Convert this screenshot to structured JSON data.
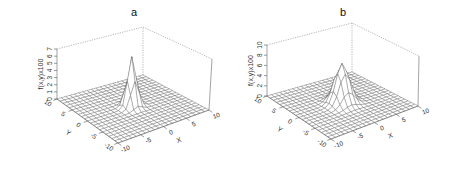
{
  "chart_data": [
    {
      "type": "surface3d",
      "title": "a",
      "xlabel": "X",
      "ylabel": "Y",
      "zlabel": "f(x,y)x100",
      "x_ticks": [
        -10,
        -5,
        0,
        5,
        10
      ],
      "y_ticks": [
        -10,
        -5,
        0,
        5,
        10
      ],
      "z_ticks": [
        0,
        1,
        2,
        3,
        4,
        5,
        6,
        7
      ],
      "xlim": [
        -10,
        10
      ],
      "ylim": [
        -10,
        10
      ],
      "zlim": [
        0,
        7
      ],
      "peak": {
        "x": 0,
        "y": 0,
        "z": 7
      },
      "grid_n": 20,
      "spread": 0.9,
      "geom": {
        "floor_left": [
          57,
          99
        ],
        "floor_front": [
          118,
          143
        ],
        "floor_right": [
          209,
          110
        ],
        "floor_back": [
          143,
          75
        ],
        "top_left": [
          57,
          49
        ],
        "top_back": [
          143,
          27
        ],
        "top_right": [
          212,
          59
        ],
        "title_pos": [
          134,
          16
        ]
      }
    },
    {
      "type": "surface3d",
      "title": "b",
      "xlabel": "X",
      "ylabel": "Y",
      "zlabel": "f(x,y)x100",
      "x_ticks": [
        -10,
        -5,
        0,
        5,
        10
      ],
      "y_ticks": [
        -10,
        -5,
        0,
        5,
        10
      ],
      "z_ticks": [
        0,
        2,
        4,
        6,
        8,
        10
      ],
      "xlim": [
        -10,
        10
      ],
      "ylim": [
        -10,
        10
      ],
      "zlim": [
        0,
        10
      ],
      "peak": {
        "x": 0,
        "y": 0,
        "z": 7.8
      },
      "grid_n": 20,
      "spread": 1.4,
      "geom": {
        "floor_left": [
          267,
          96
        ],
        "floor_front": [
          331,
          139
        ],
        "floor_right": [
          418,
          106
        ],
        "floor_back": [
          352,
          72
        ],
        "top_left": [
          267,
          45
        ],
        "top_back": [
          352,
          23
        ],
        "top_right": [
          419,
          56
        ],
        "title_pos": [
          343,
          16
        ]
      }
    }
  ],
  "colors": {
    "surface_fill": "#ffffff",
    "mesh_line": "#555555",
    "box_line": "#888888",
    "text": "#222222"
  }
}
